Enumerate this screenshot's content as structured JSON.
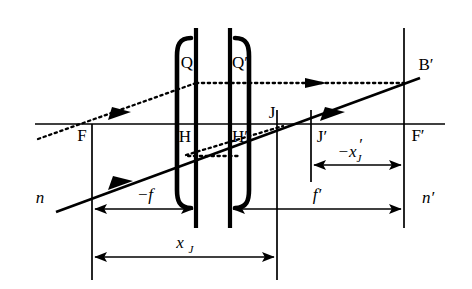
{
  "figure": {
    "background_color": "#ffffff",
    "line_color": "#000000",
    "width": 472,
    "height": 289
  },
  "labels": {
    "F": "F",
    "F_prime": "F′",
    "H": "H",
    "H_prime": "H′",
    "J": "J",
    "J_prime": "J′",
    "Q": "Q",
    "Q_prime": "Q′",
    "B_prime": "B′",
    "n": "n",
    "n_prime": "n′",
    "minus_f": "−f",
    "f_prime": "f′",
    "minus_x_j_prime_main": "−x",
    "minus_x_j_prime_sub": "J",
    "minus_x_j_prime_prime": "′",
    "x_j_main": "x",
    "x_j_sub": "J"
  },
  "geometry": {
    "optical_axis_y": 124,
    "focal_plane_F_x": 92,
    "principal_plane_H_x": 196,
    "principal_plane_H_prime_x": 230,
    "plane_J_x": 277,
    "plane_J_prime_x": 311,
    "focal_plane_F_prime_x": 404
  },
  "dimensions": [
    {
      "name": "minus-f",
      "label": "−f",
      "from_x": 92,
      "to_x": 196,
      "y": 209
    },
    {
      "name": "f-prime",
      "label": "f′",
      "from_x": 230,
      "to_x": 404,
      "y": 209
    },
    {
      "name": "minus-x-j-prime",
      "label": "−x′J",
      "from_x": 311,
      "to_x": 404,
      "y": 163
    },
    {
      "name": "x-j",
      "label": "xJ",
      "from_x": 92,
      "to_x": 277,
      "y": 256
    }
  ],
  "rays": [
    {
      "name": "dotted-incident-ray",
      "style": "dotted",
      "description": "incoming ray from lower-left through F to Q"
    },
    {
      "name": "dotted-horizontal-ray",
      "style": "dotted",
      "description": "horizontal ray from Q through Q' to B'"
    },
    {
      "name": "dotted-auxiliary-ray",
      "style": "dotted",
      "description": "rising auxiliary ray from H to J"
    },
    {
      "name": "solid-ray",
      "style": "solid",
      "description": "solid ray from lower-left through lens to B'"
    }
  ]
}
